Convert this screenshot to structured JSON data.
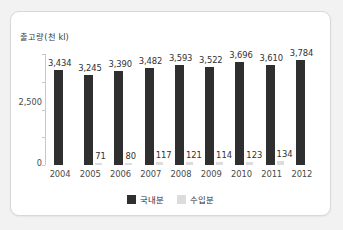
{
  "chart_data": {
    "type": "bar",
    "title": "",
    "ylabel": "출고량(천 kl)",
    "xlabel": "",
    "ylim": [
      0,
      4000
    ],
    "grid": false,
    "legend_position": "bottom-center",
    "categories": [
      "2004",
      "2005",
      "2006",
      "2007",
      "2008",
      "2009",
      "2010",
      "2011",
      "2012"
    ],
    "y_ticks": [
      "2,500",
      "0"
    ],
    "series": [
      {
        "name": "국내분",
        "color": "#2f2f2f",
        "values": [
          3434,
          3245,
          3390,
          3482,
          3593,
          3522,
          3696,
          3610,
          3784
        ],
        "labels": [
          "3,434",
          "3,245",
          "3,390",
          "3,482",
          "3,593",
          "3,522",
          "3,696",
          "3,610",
          "3,784"
        ]
      },
      {
        "name": "수입분",
        "color": "#dcdcdc",
        "values": [
          null,
          71,
          80,
          117,
          121,
          114,
          123,
          134,
          null
        ],
        "labels": [
          "",
          "71",
          "80",
          "117",
          "121",
          "114",
          "123",
          "134",
          ""
        ]
      }
    ]
  },
  "legend": {
    "items": [
      {
        "label": "국내분",
        "color": "#2f2f2f"
      },
      {
        "label": "수입분",
        "color": "#dcdcdc"
      }
    ]
  }
}
